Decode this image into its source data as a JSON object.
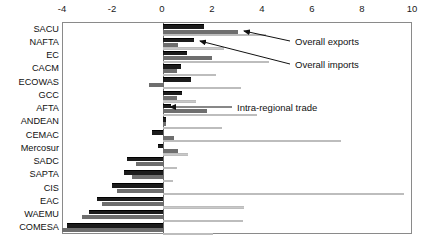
{
  "chart_data": {
    "type": "bar",
    "orientation": "horizontal",
    "title": "",
    "xlabel": "",
    "ylabel": "",
    "xlim": [
      -4,
      10
    ],
    "xticks": [
      -4,
      -2,
      0,
      2,
      4,
      6,
      8,
      10
    ],
    "xtick_labels": [
      "-4",
      "-2",
      "0",
      "2",
      "4",
      "6",
      "8",
      "10"
    ],
    "grid": false,
    "legend_position": "annotations",
    "categories": [
      "SACU",
      "NAFTA",
      "EC",
      "CACM",
      "ECOWAS",
      "GCC",
      "AFTA",
      "ANDEAN",
      "CEMAC",
      "Mercosur",
      "SADC",
      "SAPTA",
      "CIS",
      "EAC",
      "WAEMU",
      "COMESA"
    ],
    "series": [
      {
        "name": "Overall exports",
        "color": "#1c1c1c",
        "values": [
          1.65,
          1.25,
          0.95,
          0.7,
          1.1,
          0.75,
          0.3,
          0.1,
          -0.45,
          -0.2,
          -1.45,
          -1.55,
          -2.05,
          -2.65,
          -2.95,
          -3.85
        ]
      },
      {
        "name": "Overall imports",
        "color": "#6e6e6e",
        "values": [
          3.0,
          0.6,
          1.95,
          0.55,
          -0.55,
          0.55,
          1.75,
          0.1,
          0.45,
          0.6,
          -1.1,
          -1.25,
          -1.85,
          -2.45,
          -3.25,
          -4.05
        ]
      },
      {
        "name": "Intra-regional trade",
        "color": "#c9c9c9",
        "values": [
          4.1,
          2.45,
          4.25,
          2.1,
          3.1,
          1.3,
          3.75,
          2.35,
          7.1,
          1.0,
          0.55,
          0.4,
          9.65,
          3.25,
          3.2,
          2.0
        ]
      }
    ],
    "annotations": [
      {
        "label": "Overall exports",
        "target_category": "SACU",
        "target_series": "Overall imports"
      },
      {
        "label": "Overall imports",
        "target_category": "NAFTA",
        "target_series": "Overall exports"
      },
      {
        "label": "Intra-regional trade",
        "target_category": "AFTA",
        "target_series": "Intra-regional trade"
      }
    ]
  },
  "annotation_labels": {
    "overall_exports": "Overall exports",
    "overall_imports": "Overall imports",
    "intra_regional_trade": "Intra-regional trade"
  }
}
